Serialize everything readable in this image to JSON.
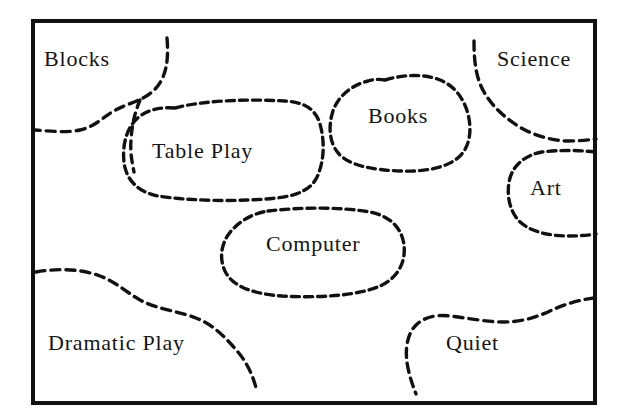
{
  "diagram": {
    "kind": "classroom-floor-plan",
    "title": "",
    "frame": {
      "stroke_color": "#111111",
      "fill_color": "#ffffff",
      "border_width_px": 4,
      "x": 31,
      "y": 19,
      "width": 566,
      "height": 386
    },
    "style": {
      "boundary_stroke_color": "#111111",
      "boundary_style": "hand-drawn-dashed",
      "label_color": "#141414",
      "background_color": "#ffffff"
    },
    "areas": [
      {
        "id": "blocks",
        "label": "Blocks",
        "shape": "open-corner",
        "corner": "top-left",
        "label_x": 44,
        "label_y": 48
      },
      {
        "id": "table-play",
        "label": "Table Play",
        "shape": "closed-rounded-blob",
        "corner": "upper-left-center",
        "label_x": 152,
        "label_y": 140
      },
      {
        "id": "books",
        "label": "Books",
        "shape": "closed-blob",
        "corner": "top-center-right",
        "label_x": 368,
        "label_y": 105
      },
      {
        "id": "science",
        "label": "Science",
        "shape": "open-corner",
        "corner": "top-right",
        "label_x": 497,
        "label_y": 48
      },
      {
        "id": "art",
        "label": "Art",
        "shape": "closed-blob-touching-wall",
        "corner": "right-middle",
        "label_x": 530,
        "label_y": 177
      },
      {
        "id": "computer",
        "label": "Computer",
        "shape": "closed-stadium-blob",
        "corner": "center",
        "label_x": 266,
        "label_y": 233
      },
      {
        "id": "dramatic-play",
        "label": "Dramatic Play",
        "shape": "open-corner",
        "corner": "bottom-left",
        "label_x": 48,
        "label_y": 332
      },
      {
        "id": "quiet",
        "label": "Quiet",
        "shape": "open-corner",
        "corner": "bottom-right",
        "label_x": 446,
        "label_y": 332
      }
    ]
  }
}
